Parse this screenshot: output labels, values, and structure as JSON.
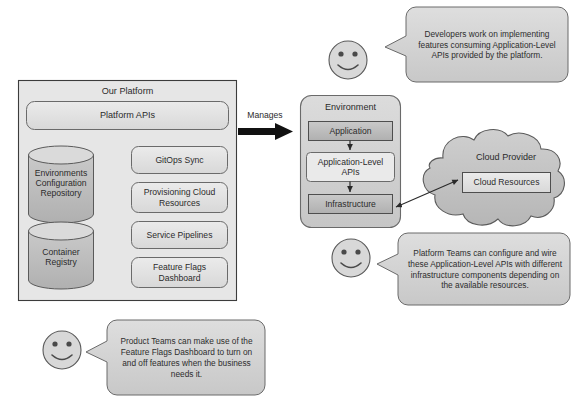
{
  "diagram": {
    "colors": {
      "page_background": "#ffffff",
      "box_fill_light": "#e3e3e3",
      "box_fill_mid": "#d0d0d0",
      "box_fill_dark": "#b8b8b8",
      "bubble_fill": "#d4d4d4",
      "cloud_fill": "#c2c2c2",
      "stroke": "#5a5a5a",
      "stroke_dark": "#3c3c3c",
      "arrow_black": "#1a1a1a",
      "text": "#2b2b2b"
    }
  },
  "platform": {
    "title": "Our Platform",
    "platform_apis": "Platform APIs",
    "datastores": [
      {
        "label": "Environments\nConfiguration\nRepository",
        "name": "environments-configuration-repository"
      },
      {
        "label": "Container\nRegistry",
        "name": "container-registry"
      }
    ],
    "services": [
      {
        "label": "GitOps Sync",
        "name": "gitops-sync"
      },
      {
        "label": "Provisioning Cloud\nResources",
        "name": "provisioning-cloud-resources"
      },
      {
        "label": "Service Pipelines",
        "name": "service-pipelines"
      },
      {
        "label": "Feature Flags\nDashboard",
        "name": "feature-flags-dashboard"
      }
    ]
  },
  "connector": {
    "manages_label": "Manages"
  },
  "environment": {
    "title": "Environment",
    "layers": [
      {
        "label": "Application",
        "name": "application"
      },
      {
        "label": "Application-Level\nAPIs",
        "name": "application-level-apis"
      },
      {
        "label": "Infrastructure",
        "name": "infrastructure"
      }
    ]
  },
  "cloud": {
    "title": "Cloud Provider",
    "resources": "Cloud Resources"
  },
  "bubbles": [
    {
      "name": "developers-note",
      "text": "Developers work on implementing features consuming Application-Level APIs provided by the platform.",
      "actor": "smiley-face-icon"
    },
    {
      "name": "platform-teams-note",
      "text": "Platform Teams can configure and wire these Application-Level APIs with different infrastructure components depending on the available resources.",
      "actor": "smiley-face-icon"
    },
    {
      "name": "product-teams-note",
      "text": "Product Teams can make use of the Feature Flags Dashboard to turn on and off features when the business needs it.",
      "actor": "smiley-face-icon"
    }
  ]
}
